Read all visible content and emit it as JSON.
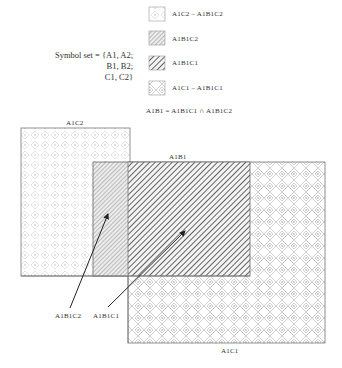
{
  "symbol_set": {
    "lines": [
      "Symbol set = {A1, A2;",
      "B1, B2;",
      "C1, C2}"
    ]
  },
  "legend": {
    "items": [
      {
        "pattern": "dots-light",
        "label": "A1C2 – A1B1C2"
      },
      {
        "pattern": "hatch-dense",
        "label": "A1B1C2"
      },
      {
        "pattern": "hatch-bold",
        "label": "A1B1C1"
      },
      {
        "pattern": "diamond-light",
        "label": "A1C1 – A1B1C1"
      }
    ],
    "formula": "A1B1 = A1B1C1 ∩ A1B1C2"
  },
  "regions": {
    "a1c2_label": "A1C2",
    "a1b1_label": "A1B1",
    "a1c1_label": "A1C1"
  },
  "arrows": {
    "a1b1c2_label": "A1B1C2",
    "a1b1c1_label": "A1B1C1"
  },
  "colors": {
    "stroke": "#777777",
    "hatch": "#555555",
    "light_pattern": "#cfcfcf"
  }
}
